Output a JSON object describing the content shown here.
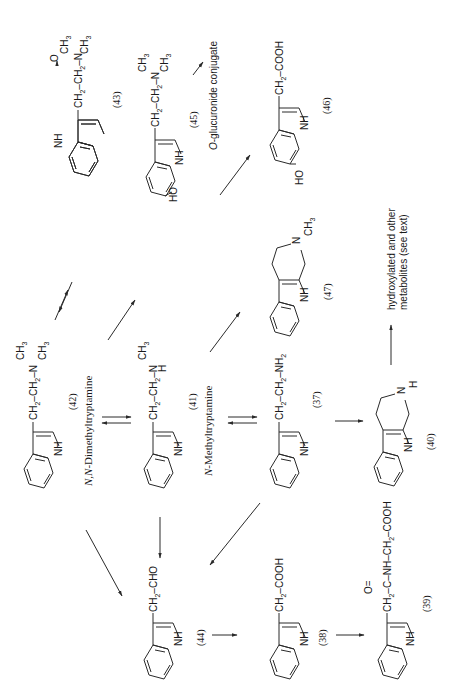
{
  "figure": {
    "orientation": "rotated 90° counter-clockwise"
  },
  "compounds": {
    "c42": {
      "number": "(42)",
      "chain": "CH2–CH2–N(CH3)2",
      "name": "N,N-Dimethyltryptamine"
    },
    "c41": {
      "number": "(41)",
      "chain": "CH2–CH2–N(CH3)H",
      "name": "N-Methyltryptamine"
    },
    "c37": {
      "number": "(37)",
      "chain": "CH2–CH2–NH2"
    },
    "c43": {
      "number": "(43)",
      "chain": "CH2–CH2–N(→O)(CH3)2"
    },
    "c45": {
      "number": "(45)",
      "chain": "CH2–CH2–N(CH3)2",
      "substituent": "HO"
    },
    "c46": {
      "number": "(46)",
      "chain": "CH2–COOH",
      "substituent": "HO"
    },
    "c47": {
      "number": "(47)",
      "ring_substituent": "N–CH3"
    },
    "c40": {
      "number": "(40)",
      "ring_substituent": "N–H"
    },
    "c44": {
      "number": "(44)",
      "chain": "CH2–CHO"
    },
    "c38": {
      "number": "(38)",
      "chain": "CH2–COOH"
    },
    "c39": {
      "number": "(39)",
      "chain": "CH2–C(=O)–NH–CH2–COOH"
    }
  },
  "labels": {
    "o_glucuronide": "O-glucuronide conjugate",
    "hydroxylated_line1": "hydroxylated and other",
    "hydroxylated_line2": "metabolites (see text)",
    "nh": "NH",
    "n": "N",
    "h": "H",
    "ch2": "CH",
    "ch3": "CH",
    "nh2": "NH",
    "sub2": "2",
    "sub3": "3",
    "ho": "HO",
    "o": "O",
    "cho": "CHO",
    "cooh": "COOH",
    "c": "C",
    "nh_amide": "NH",
    "dash": "–",
    "dmt_name_italic": "N,N",
    "dmt_name_rest": "-Dimethyltryptamine",
    "nmt_name_italic": "N",
    "nmt_name_rest": "-Methyltryptamine",
    "o_italic": "O",
    "o_gluc_rest": "-glucuronide conjugate"
  },
  "arrows": [
    {
      "from": "42",
      "to": "43",
      "type": "reversible"
    },
    {
      "from": "42",
      "to": "41",
      "type": "reversible"
    },
    {
      "from": "41",
      "to": "37",
      "type": "reversible"
    },
    {
      "from": "42",
      "to": "45",
      "type": "forward"
    },
    {
      "from": "45",
      "to": "O-glucuronide conjugate",
      "type": "forward"
    },
    {
      "from": "45",
      "to": "46",
      "type": "forward"
    },
    {
      "from": "41",
      "to": "47",
      "type": "forward"
    },
    {
      "from": "37",
      "to": "40",
      "type": "forward"
    },
    {
      "from": "40",
      "to": "hydroxylated and other metabolites",
      "type": "forward"
    },
    {
      "from": "42",
      "to": "44",
      "type": "forward"
    },
    {
      "from": "41",
      "to": "44",
      "type": "forward"
    },
    {
      "from": "37",
      "to": "44",
      "type": "forward"
    },
    {
      "from": "44",
      "to": "38",
      "type": "forward"
    },
    {
      "from": "38",
      "to": "39",
      "type": "forward"
    }
  ]
}
